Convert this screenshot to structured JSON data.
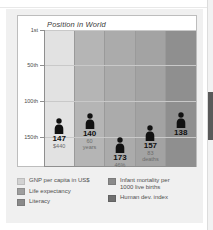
{
  "chart_data": {
    "type": "bar",
    "title": "Position in World",
    "xlabel": "",
    "ylabel": "",
    "ylim": [
      1,
      190
    ],
    "y_ticks": [
      "1st",
      "50th",
      "100th",
      "150th"
    ],
    "y_tick_values": [
      1,
      50,
      100,
      150
    ],
    "grid": true,
    "legend_position": "bottom",
    "categories": [
      "GNP per capita in US$",
      "Life expectancy",
      "Literacy",
      "Infant mortality per 1000 live births",
      "Human dev. index"
    ],
    "values": [
      147,
      140,
      173,
      157,
      138
    ],
    "annotations": [
      "$440",
      "60\nyears",
      "46%",
      "83\ndeaths",
      ""
    ],
    "series": [
      {
        "name": "Position in World",
        "values": [
          147,
          140,
          173,
          157,
          138
        ]
      }
    ],
    "points": [
      {
        "rank": "147",
        "sub": "$440",
        "value": 147,
        "band_color": "#e2e2e2"
      },
      {
        "rank": "140",
        "sub": "60\nyears",
        "value": 140,
        "band_color": "#b5b5b5"
      },
      {
        "rank": "173",
        "sub": "46%",
        "value": 173,
        "band_color": "#ababab"
      },
      {
        "rank": "157",
        "sub": "83\ndeaths",
        "value": 157,
        "band_color": "#a3a3a3"
      },
      {
        "rank": "138",
        "sub": "",
        "value": 138,
        "band_color": "#8f8f8f"
      }
    ]
  },
  "chart": {
    "title": "Position in World",
    "y_axis": {
      "ticks": [
        {
          "label": "1st"
        },
        {
          "label": "50th"
        },
        {
          "label": "100th"
        },
        {
          "label": "150th"
        }
      ]
    },
    "columns": [
      {
        "rank": "147",
        "sub": "$440"
      },
      {
        "rank": "140",
        "sub": "60\nyears"
      },
      {
        "rank": "173",
        "sub": "46%"
      },
      {
        "rank": "157",
        "sub": "83\ndeaths"
      },
      {
        "rank": "138",
        "sub": ""
      }
    ]
  },
  "legend": {
    "left": [
      {
        "label": "GNP per capita in US$",
        "color": "#d2d2d2"
      },
      {
        "label": "Life expectancy",
        "color": "#9e9e9e"
      },
      {
        "label": "Literacy",
        "color": "#8a8a8a"
      }
    ],
    "right": [
      {
        "label": "Infant mortality per\n1000 live births",
        "color": "#8a8a8a"
      },
      {
        "label": "Human dev. index",
        "color": "#6f6f6f"
      }
    ]
  },
  "colors": {
    "card_background": "#f0f0f0",
    "panel_background": "#ffffff",
    "panel_border": "#bdbdbd",
    "axis": "#8f8f8f",
    "gridline": "#c9c9c9",
    "figure": "#111111",
    "rank_text": "#101010",
    "sub_text": "#6b6b6b"
  }
}
